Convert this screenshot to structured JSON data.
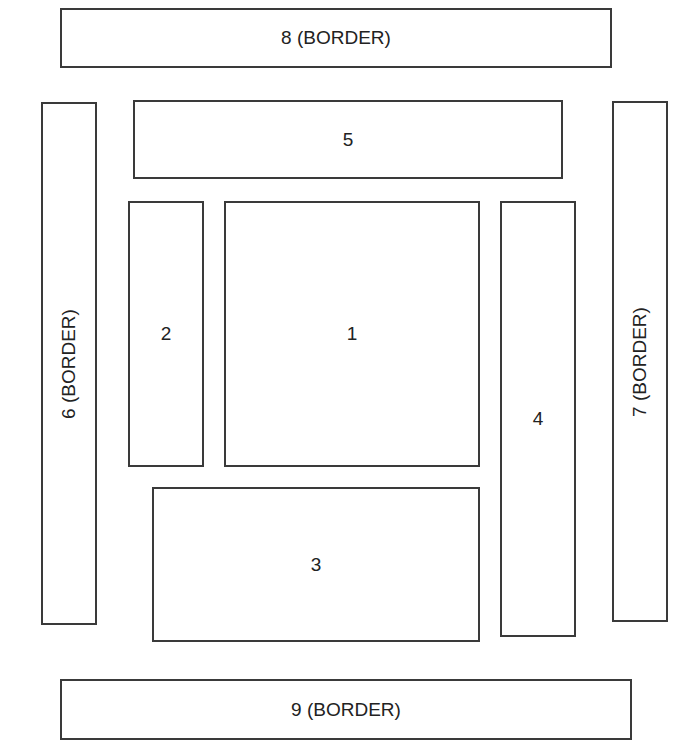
{
  "diagram": {
    "type": "layout-regions",
    "colors": {
      "background": "#ffffff",
      "stroke": "#3a3a3a",
      "text": "#222222"
    },
    "regions": [
      {
        "id": "1",
        "label": "1",
        "x": 224,
        "y": 201,
        "w": 256,
        "h": 266,
        "orientation": "horizontal"
      },
      {
        "id": "2",
        "label": "2",
        "x": 128,
        "y": 201,
        "w": 76,
        "h": 266,
        "orientation": "horizontal"
      },
      {
        "id": "3",
        "label": "3",
        "x": 152,
        "y": 487,
        "w": 328,
        "h": 155,
        "orientation": "horizontal"
      },
      {
        "id": "4",
        "label": "4",
        "x": 500,
        "y": 201,
        "w": 76,
        "h": 436,
        "orientation": "horizontal"
      },
      {
        "id": "5",
        "label": "5",
        "x": 133,
        "y": 100,
        "w": 430,
        "h": 79,
        "orientation": "horizontal"
      },
      {
        "id": "6",
        "label": "6 (BORDER)",
        "x": 41,
        "y": 102,
        "w": 56,
        "h": 523,
        "orientation": "vertical"
      },
      {
        "id": "7",
        "label": "7 (BORDER)",
        "x": 612,
        "y": 101,
        "w": 56,
        "h": 521,
        "orientation": "vertical"
      },
      {
        "id": "8",
        "label": "8 (BORDER)",
        "x": 60,
        "y": 8,
        "w": 552,
        "h": 60,
        "orientation": "horizontal"
      },
      {
        "id": "9",
        "label": "9 (BORDER)",
        "x": 60,
        "y": 679,
        "w": 572,
        "h": 61,
        "orientation": "horizontal"
      }
    ]
  }
}
